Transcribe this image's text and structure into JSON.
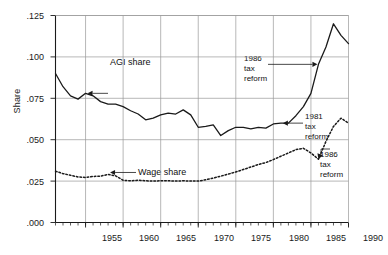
{
  "chart_data": {
    "type": "line",
    "title": "",
    "xlabel": "",
    "ylabel": "Share",
    "xlim": [
      1951,
      1990
    ],
    "ylim": [
      0.0,
      0.125
    ],
    "grid": true,
    "legend_position": "inline-annotations",
    "y_ticks": [
      ".000",
      ".025",
      ".050",
      ".075",
      ".100",
      ".125"
    ],
    "y_tick_values": [
      0.0,
      0.025,
      0.05,
      0.075,
      0.1,
      0.125
    ],
    "x_ticks": [
      "1955",
      "1960",
      "1965",
      "1970",
      "1975",
      "1980",
      "1985",
      "1990"
    ],
    "x_tick_values": [
      1955,
      1960,
      1965,
      1970,
      1975,
      1980,
      1985,
      1990
    ],
    "x_minor_tick_step": 1,
    "series": [
      {
        "name": "AGI share",
        "style": "solid",
        "color": "#1a1a1a",
        "x": [
          1951,
          1952,
          1953,
          1954,
          1955,
          1956,
          1957,
          1958,
          1959,
          1960,
          1961,
          1962,
          1963,
          1964,
          1965,
          1966,
          1967,
          1968,
          1969,
          1970,
          1971,
          1972,
          1973,
          1974,
          1975,
          1976,
          1977,
          1978,
          1979,
          1980,
          1981,
          1982,
          1983,
          1984,
          1985,
          1986,
          1987,
          1988,
          1989,
          1990
        ],
        "values": [
          0.09,
          0.082,
          0.0765,
          0.0745,
          0.078,
          0.0765,
          0.073,
          0.0715,
          0.0715,
          0.07,
          0.0675,
          0.0655,
          0.062,
          0.063,
          0.065,
          0.066,
          0.0655,
          0.068,
          0.065,
          0.0575,
          0.058,
          0.059,
          0.0525,
          0.0555,
          0.0575,
          0.0575,
          0.0565,
          0.0575,
          0.057,
          0.0595,
          0.06,
          0.06,
          0.0645,
          0.07,
          0.078,
          0.0955,
          0.106,
          0.12,
          0.113,
          0.108
        ]
      },
      {
        "name": "Wage share",
        "style": "dotted",
        "color": "#1a1a1a",
        "x": [
          1951,
          1952,
          1953,
          1954,
          1955,
          1956,
          1957,
          1958,
          1959,
          1960,
          1961,
          1962,
          1963,
          1964,
          1965,
          1966,
          1967,
          1968,
          1969,
          1970,
          1971,
          1972,
          1973,
          1974,
          1975,
          1976,
          1977,
          1978,
          1979,
          1980,
          1981,
          1982,
          1983,
          1984,
          1985,
          1986,
          1987,
          1988,
          1989,
          1990
        ],
        "values": [
          0.031,
          0.0295,
          0.0285,
          0.0275,
          0.0272,
          0.0278,
          0.028,
          0.029,
          0.0282,
          0.0255,
          0.0252,
          0.0255,
          0.0252,
          0.025,
          0.0252,
          0.0252,
          0.025,
          0.0252,
          0.025,
          0.025,
          0.0258,
          0.0268,
          0.028,
          0.0292,
          0.0305,
          0.032,
          0.0335,
          0.035,
          0.0362,
          0.038,
          0.04,
          0.042,
          0.044,
          0.0448,
          0.042,
          0.0382,
          0.049,
          0.058,
          0.063,
          0.06
        ]
      }
    ],
    "annotations": [
      {
        "label": "AGI share",
        "kind": "series-pointer",
        "points_to_year": 1955,
        "points_to_value": 0.078
      },
      {
        "label": "Wage share",
        "kind": "series-pointer",
        "points_to_year": 1958,
        "points_to_value": 0.029
      },
      {
        "label_lines": [
          "1986",
          "tax",
          "reform"
        ],
        "kind": "event-pointer",
        "points_to_year": 1986,
        "points_to_value": 0.0955,
        "series": "AGI share"
      },
      {
        "label_lines": [
          "1981",
          "tax",
          "reform"
        ],
        "kind": "event-pointer",
        "points_to_year": 1981,
        "points_to_value": 0.06,
        "series": "AGI share"
      },
      {
        "label_lines": [
          "1986",
          "tax",
          "reform"
        ],
        "kind": "event-pointer",
        "points_to_year": 1986,
        "points_to_value": 0.0382,
        "series": "Wage share"
      }
    ]
  },
  "axes": {
    "y_label": "Share",
    "y_ticks": [
      ".125",
      ".100",
      ".075",
      ".050",
      ".025",
      ".000"
    ],
    "x_ticks": [
      "1955",
      "1960",
      "1965",
      "1970",
      "1975",
      "1980",
      "1985",
      "1990"
    ]
  },
  "annotations": {
    "agi_share": "AGI share",
    "wage_share": "Wage share",
    "tax1986_top_l1": "1986",
    "tax1986_top_l2": "tax",
    "tax1986_top_l3": "reform",
    "tax1981_l1": "1981",
    "tax1981_l2": "tax",
    "tax1981_l3": "reform",
    "tax1986_bot_l1": "1986",
    "tax1986_bot_l2": "tax",
    "tax1986_bot_l3": "reform"
  },
  "colors": {
    "ink": "#1a1a1a",
    "grid": "#9a9a9a",
    "background": "#ffffff"
  }
}
